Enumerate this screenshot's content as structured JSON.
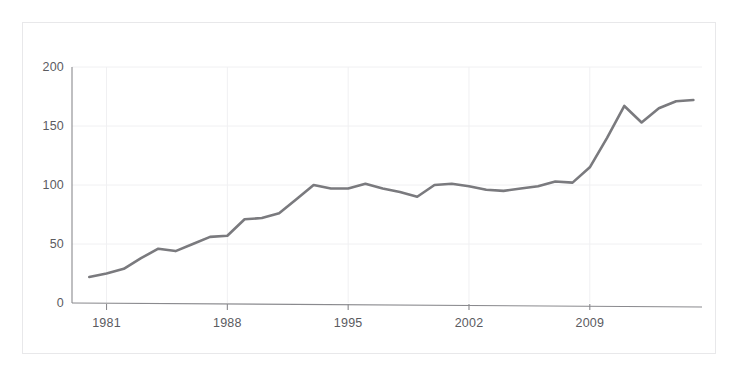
{
  "chart_data": {
    "type": "line",
    "title": "",
    "subtitle": "",
    "xlabel": "",
    "ylabel": "",
    "xlim": [
      1979.0,
      2015.5
    ],
    "ylim": [
      0,
      200
    ],
    "grid": true,
    "legend": null,
    "legend_position": "none",
    "line_color": "#7a7a7e",
    "axis_color": "#8a8a8e",
    "grid_color": "#f0f0f2",
    "background_color": "#ffffff",
    "frame_border_color": "#e8e8ea",
    "y_ticks": [
      0,
      50,
      100,
      150,
      200
    ],
    "y_tick_labels": [
      "0",
      "50",
      "100",
      "150",
      "200"
    ],
    "x_ticks": [
      1981,
      1988,
      1995,
      2002,
      2009
    ],
    "x_tick_labels": [
      "1981",
      "1988",
      "1995",
      "2002",
      "2009"
    ],
    "x": [
      1980,
      1981,
      1982,
      1983,
      1984,
      1985,
      1986,
      1987,
      1988,
      1989,
      1990,
      1991,
      1992,
      1993,
      1994,
      1995,
      1996,
      1997,
      1998,
      1999,
      2000,
      2001,
      2002,
      2003,
      2004,
      2005,
      2006,
      2007,
      2008,
      2009,
      2010,
      2011,
      2012,
      2013,
      2014,
      2015
    ],
    "values": [
      22,
      25,
      29,
      38,
      46,
      44,
      50,
      56,
      57,
      71,
      72,
      76,
      88,
      100,
      97,
      97,
      101,
      97,
      94,
      90,
      100,
      101,
      99,
      96,
      95,
      97,
      99,
      103,
      102,
      115,
      140,
      167,
      153,
      165,
      171,
      172
    ],
    "series": [
      {
        "name": "series-1",
        "color": "#7a7a7e",
        "values": [
          22,
          25,
          29,
          38,
          46,
          44,
          50,
          56,
          57,
          71,
          72,
          76,
          88,
          100,
          97,
          97,
          101,
          97,
          94,
          90,
          100,
          101,
          99,
          96,
          95,
          97,
          99,
          103,
          102,
          115,
          140,
          167,
          153,
          165,
          171,
          172
        ]
      }
    ]
  },
  "axes": {
    "y_labels": [
      "200",
      "150",
      "100",
      "50",
      "0"
    ],
    "x_labels": [
      "1981",
      "1988",
      "1995",
      "2002",
      "2009"
    ]
  }
}
